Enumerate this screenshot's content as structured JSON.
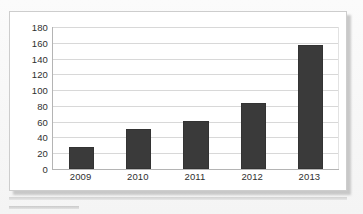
{
  "chart_data": {
    "type": "bar",
    "title": "",
    "xlabel": "",
    "ylabel": "",
    "categories": [
      "2009",
      "2010",
      "2011",
      "2012",
      "2013"
    ],
    "values": [
      28,
      51,
      61,
      84,
      157
    ],
    "series": [
      {
        "name": "",
        "values": [
          28,
          51,
          61,
          84,
          157
        ]
      }
    ],
    "ylim": [
      0,
      180
    ],
    "y_ticks": [
      0,
      20,
      40,
      60,
      80,
      100,
      120,
      140,
      160,
      180
    ],
    "y_tick_labels": [
      "0",
      "20",
      "40",
      "60",
      "80",
      "100",
      "120",
      "140",
      "160",
      "180"
    ],
    "grid": true,
    "grid_axis": "y",
    "legend": false,
    "legend_position": "none",
    "bar_color": "#3a3a3a",
    "plot_background": "#ffffff",
    "gridline_color": "#d8d8d8",
    "axis_color": "#b4b4b4",
    "frame_border_color": "#cdcdcd",
    "annotations": []
  },
  "figure": {
    "page_background": "#f7f7f7",
    "shadow_color": "#b9b9b9"
  }
}
